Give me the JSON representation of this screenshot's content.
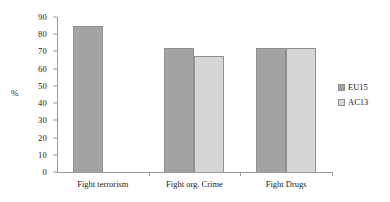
{
  "chart_data": {
    "type": "bar",
    "title": "",
    "xlabel": "",
    "ylabel": "%",
    "ylim": [
      0,
      90
    ],
    "ytick_step": 10,
    "yticks": [
      "90",
      "80",
      "70",
      "60",
      "50",
      "40",
      "30",
      "20",
      "10",
      "0"
    ],
    "grid": false,
    "legend_position": "right",
    "categories": [
      "Fight terrorism",
      "Fight org. Crime",
      "Fight Drugs"
    ],
    "series": [
      {
        "name": "EU15",
        "color": "#a3a3a3",
        "values": [
          85,
          72,
          72
        ]
      },
      {
        "name": "AC13",
        "color": "#d6d6d6",
        "values": [
          null,
          67.5,
          72
        ]
      }
    ]
  },
  "legend": {
    "items": [
      {
        "label": "EU15"
      },
      {
        "label": "AC13"
      }
    ]
  },
  "axis": {
    "y_title": "%"
  }
}
